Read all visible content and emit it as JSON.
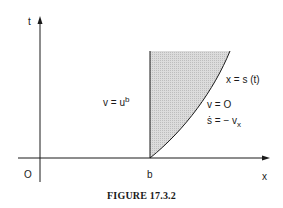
{
  "figure": {
    "caption": "FIGURE 17.3.2",
    "axes": {
      "y_label": "t",
      "x_label": "x",
      "origin_label": "O",
      "b_label": "b"
    },
    "regions": {
      "left": {
        "lhs": "v = u",
        "sup": "b"
      },
      "curve": "x = s (t)",
      "right_v": "v = O",
      "right_s_lhs": "ṡ = − v",
      "right_s_sub": "x"
    },
    "colors": {
      "ink": "#1a1a1a",
      "shade": "#cfcfcf",
      "background": "#ffffff"
    }
  }
}
